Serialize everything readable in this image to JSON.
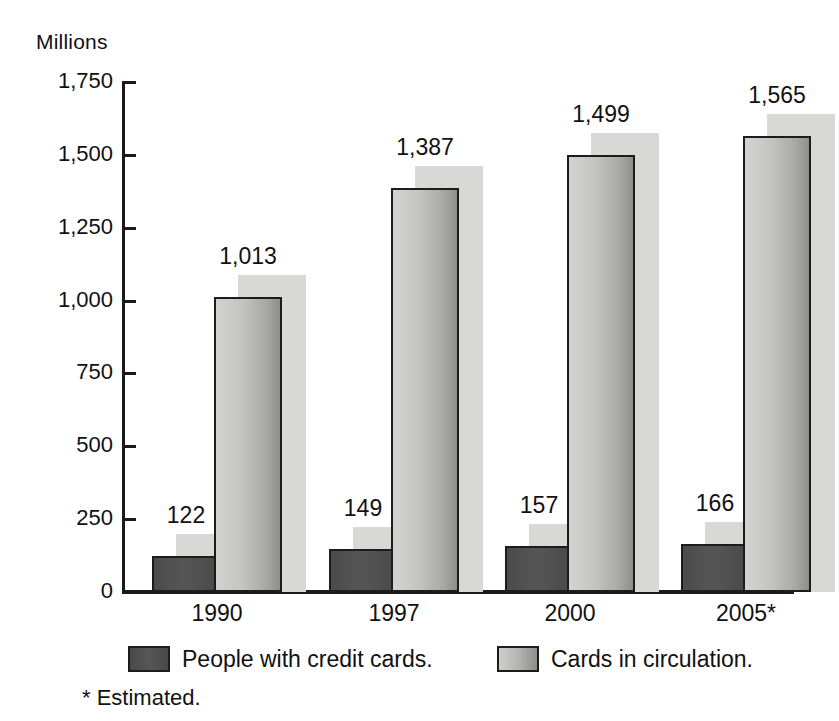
{
  "chart_data": {
    "type": "bar",
    "title": "",
    "ylabel": "Millions",
    "xlabel": "",
    "categories": [
      "1990",
      "1997",
      "2000",
      "2005*"
    ],
    "series": [
      {
        "name": "People with credit cards.",
        "values": [
          122,
          149,
          157,
          166
        ],
        "value_labels": [
          "122",
          "149",
          "157",
          "166"
        ],
        "color": "#4f4f4f"
      },
      {
        "name": "Cards in circulation.",
        "values": [
          1013,
          1387,
          1499,
          1565
        ],
        "value_labels": [
          "1,013",
          "1,387",
          "1,499",
          "1,565"
        ],
        "color": "#b4b4b2"
      }
    ],
    "ylim": [
      0,
      1750
    ],
    "yticks": [
      0,
      250,
      500,
      750,
      1000,
      1250,
      1500,
      1750
    ],
    "ytick_labels": [
      "0",
      "250",
      "500",
      "750",
      "1,000",
      "1,250",
      "1,500",
      "1,750"
    ],
    "grid": false,
    "legend_position": "bottom",
    "shadow_color": "#d8d8d6",
    "axis_color": "#1a1a1a"
  },
  "footnote": "* Estimated."
}
